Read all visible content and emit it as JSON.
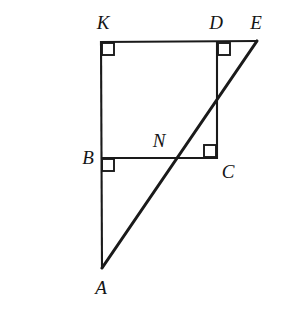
{
  "figure": {
    "background_color": "#ffffff",
    "stroke_color": "#1a1a1a",
    "canvas": {
      "width": 282,
      "height": 322
    },
    "points": [
      {
        "id": "K",
        "label": "K",
        "x": 101,
        "y": 42,
        "label_x": 103,
        "label_y": 22
      },
      {
        "id": "D",
        "label": "D",
        "x": 217,
        "y": 42,
        "label_x": 216,
        "label_y": 22
      },
      {
        "id": "E",
        "label": "E",
        "x": 257,
        "y": 41,
        "label_x": 256,
        "label_y": 22
      },
      {
        "id": "B",
        "label": "B",
        "x": 101,
        "y": 158,
        "label_x": 88,
        "label_y": 157
      },
      {
        "id": "N",
        "label": "N",
        "x": 178,
        "y": 158,
        "label_x": 159,
        "label_y": 140
      },
      {
        "id": "C",
        "label": "C",
        "x": 217,
        "y": 158,
        "label_x": 228,
        "label_y": 171
      },
      {
        "id": "A",
        "label": "A",
        "x": 102,
        "y": 268,
        "label_x": 101,
        "label_y": 287
      }
    ],
    "segments": [
      {
        "id": "KE",
        "from": "K",
        "to": "E",
        "weight": "thin",
        "x1": 100,
        "y1": 42,
        "x2": 258,
        "y2": 41
      },
      {
        "id": "KA",
        "from": "K",
        "to": "A",
        "weight": "thin",
        "x1": 101,
        "y1": 41,
        "x2": 102,
        "y2": 269
      },
      {
        "id": "BC",
        "from": "B",
        "to": "C",
        "weight": "thin",
        "x1": 101,
        "y1": 158,
        "x2": 218,
        "y2": 158
      },
      {
        "id": "DC",
        "from": "D",
        "to": "C",
        "weight": "thin",
        "x1": 217,
        "y1": 42,
        "x2": 217,
        "y2": 159
      },
      {
        "id": "AE",
        "from": "A",
        "to": "E",
        "weight": "thick",
        "x1": 102,
        "y1": 268,
        "x2": 257,
        "y2": 41
      }
    ],
    "right_angles": [
      {
        "id": "angle-K",
        "at": "K",
        "size": 12,
        "dx": 1,
        "dy": 1
      },
      {
        "id": "angle-D",
        "at": "D",
        "size": 12,
        "dx": 1,
        "dy": 1
      },
      {
        "id": "angle-B",
        "at": "B",
        "size": 12,
        "dx": 1,
        "dy": 1
      },
      {
        "id": "angle-C",
        "at": "C",
        "size": 12,
        "dx": -13,
        "dy": -13
      }
    ]
  }
}
